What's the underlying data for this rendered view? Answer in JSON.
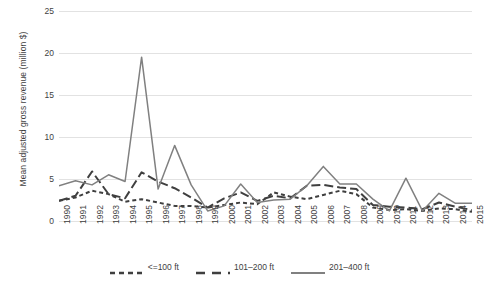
{
  "chart_data": {
    "type": "line",
    "title": "",
    "xlabel": "",
    "ylabel": "Mean adjusted gross revenue (million $)",
    "ylim": [
      0,
      25
    ],
    "yticks": [
      0,
      5,
      10,
      15,
      20,
      25
    ],
    "grid": true,
    "legend_position": "bottom",
    "categories": [
      "1990",
      "1991",
      "1992",
      "1993",
      "1994",
      "1995",
      "1996",
      "1997",
      "1998",
      "1999",
      "2000",
      "2001",
      "2002",
      "2003",
      "2004",
      "2005",
      "2006",
      "2007",
      "2008",
      "2009",
      "2010",
      "2011",
      "2012",
      "2013",
      "2014",
      "2015"
    ],
    "series": [
      {
        "name": "<=100 ft",
        "style": "short-dash",
        "color": "#3f3f3f",
        "values": [
          2.4,
          2.8,
          3.6,
          3.2,
          2.3,
          2.6,
          2.2,
          1.8,
          1.8,
          1.6,
          1.9,
          2.2,
          2.0,
          3.4,
          2.9,
          2.6,
          3.1,
          3.6,
          3.2,
          1.6,
          1.3,
          1.4,
          1.2,
          1.5,
          1.4,
          1.1
        ]
      },
      {
        "name": "101–200 ft",
        "style": "long-dash",
        "color": "#3f3f3f",
        "values": [
          2.4,
          3.0,
          5.9,
          3.2,
          2.7,
          5.8,
          4.7,
          3.9,
          2.8,
          1.6,
          2.7,
          3.4,
          2.4,
          3.0,
          2.7,
          4.2,
          4.3,
          4.0,
          3.8,
          1.9,
          1.7,
          1.6,
          1.4,
          2.2,
          1.7,
          1.3
        ]
      },
      {
        "name": "201–400 ft",
        "style": "solid",
        "color": "#808080",
        "values": [
          4.2,
          4.8,
          4.3,
          5.5,
          4.7,
          19.5,
          3.8,
          9.0,
          4.3,
          1.2,
          1.8,
          4.4,
          2.2,
          2.5,
          2.6,
          4.2,
          6.5,
          4.4,
          4.4,
          2.6,
          1.2,
          5.1,
          1.2,
          3.3,
          2.1,
          2.1
        ]
      }
    ]
  },
  "legend": {
    "items": [
      {
        "label": "<=100 ft"
      },
      {
        "label": "101–200 ft"
      },
      {
        "label": "201–400 ft"
      }
    ]
  }
}
